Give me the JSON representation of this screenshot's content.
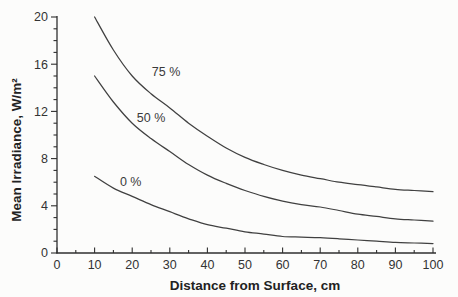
{
  "figure": {
    "background": "#fcfcfb",
    "axis_color": "#2f2f2f",
    "curve_color": "#404040",
    "text_color": "#333333"
  },
  "chart_data": {
    "type": "line",
    "title": "",
    "xlabel": "Distance from Surface, cm",
    "ylabel": "Mean Irradiance, W/m²",
    "xlim": [
      0,
      100
    ],
    "ylim": [
      0,
      20
    ],
    "x_major_ticks": [
      0,
      10,
      20,
      30,
      40,
      50,
      60,
      70,
      80,
      90,
      100
    ],
    "x_minor_step": 5,
    "y_major_ticks": [
      0,
      4,
      8,
      12,
      16,
      20
    ],
    "y_minor_step": 1,
    "grid": false,
    "legend_position": "inline-curve-labels",
    "x": [
      10,
      15,
      20,
      25,
      30,
      35,
      40,
      45,
      50,
      55,
      60,
      65,
      70,
      75,
      80,
      85,
      90,
      95,
      100
    ],
    "series": [
      {
        "name": "75 %",
        "values": [
          20.0,
          17.2,
          15.0,
          13.5,
          12.3,
          11.0,
          9.9,
          8.9,
          8.1,
          7.5,
          7.0,
          6.6,
          6.3,
          6.0,
          5.8,
          5.6,
          5.4,
          5.3,
          5.2
        ],
        "label": "75 %",
        "label_pos": {
          "x": 29.0,
          "y": 15.35
        }
      },
      {
        "name": "50 %",
        "values": [
          15.0,
          12.8,
          11.0,
          9.7,
          8.6,
          7.5,
          6.6,
          5.9,
          5.3,
          4.8,
          4.4,
          4.1,
          3.9,
          3.6,
          3.3,
          3.1,
          2.9,
          2.8,
          2.7
        ],
        "label": "50 %",
        "label_pos": {
          "x": 25.0,
          "y": 11.45
        }
      },
      {
        "name": "0 %",
        "values": [
          6.5,
          5.5,
          4.8,
          4.1,
          3.5,
          2.9,
          2.4,
          2.1,
          1.8,
          1.6,
          1.4,
          1.35,
          1.3,
          1.2,
          1.1,
          1.0,
          0.9,
          0.85,
          0.8
        ],
        "label": "0 %",
        "label_pos": {
          "x": 19.6,
          "y": 6.0
        }
      }
    ]
  }
}
